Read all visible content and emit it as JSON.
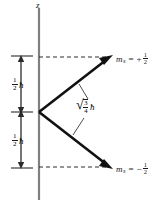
{
  "figure": {
    "background_color": "#ffffff",
    "ink_color": "#1a1a1a",
    "axis": {
      "name": "z-axis",
      "label": "z",
      "x": 39,
      "y_top": 8,
      "y_bottom": 200
    },
    "vectors": [
      {
        "name": "spin-up-vector",
        "label_sym": "m",
        "label_sub": "s",
        "label_eq": "=",
        "label_sign": "+",
        "label_num": "1",
        "label_den": "2",
        "origin_x": 39,
        "origin_y": 112,
        "tip_x": 111,
        "tip_y": 57
      },
      {
        "name": "spin-down-vector",
        "label_sym": "m",
        "label_sub": "s",
        "label_eq": "=",
        "label_sign": "−",
        "label_num": "1",
        "label_den": "2",
        "origin_x": 39,
        "origin_y": 112,
        "tip_x": 111,
        "tip_y": 167
      }
    ],
    "dashed_lines": [
      {
        "name": "upper-projection-dashed-line",
        "x1": 39,
        "y1": 57,
        "x2": 108,
        "y2": 57
      },
      {
        "name": "lower-projection-dashed-line",
        "x1": 39,
        "y1": 167,
        "x2": 108,
        "y2": 167
      }
    ],
    "measurements": [
      {
        "name": "upper-half-hbar-measure",
        "num": "1",
        "den": "2",
        "unit": "ħ",
        "x": 21,
        "y_top": 57,
        "y_bottom": 112
      },
      {
        "name": "lower-half-hbar-measure",
        "num": "1",
        "den": "2",
        "unit": "ħ",
        "x": 21,
        "y_top": 112,
        "y_bottom": 167
      }
    ],
    "magnitude_label": {
      "name": "spin-magnitude-label",
      "radical": "√",
      "num": "3",
      "den": "4",
      "unit": "ħ",
      "x": 78,
      "y": 105
    },
    "leader_lines": [
      {
        "name": "upper-leader-line",
        "x1": 88,
        "y1": 100,
        "x2": 79,
        "y2": 85
      },
      {
        "name": "lower-leader-line",
        "x1": 85,
        "y1": 117,
        "x2": 74,
        "y2": 134
      }
    ]
  }
}
